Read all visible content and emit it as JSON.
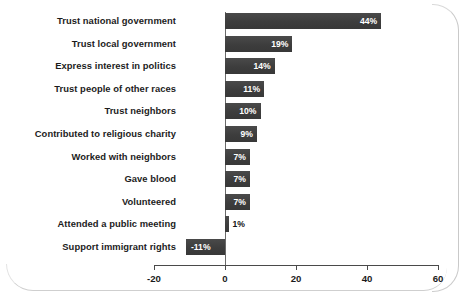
{
  "chart_data": {
    "type": "bar",
    "orientation": "horizontal",
    "title": "",
    "subtitle": "",
    "xlabel": "",
    "ylabel": "",
    "xlim": [
      -20,
      60
    ],
    "xticks": [
      -20,
      0,
      20,
      40,
      60
    ],
    "xtick_labels": [
      "-20",
      "0",
      "20",
      "40",
      "60"
    ],
    "grid": false,
    "legend": false,
    "value_suffix": "%",
    "bar_color": "#424242",
    "label_color_inside": "#ffffff",
    "label_color_outside": "#141414",
    "categories": [
      "Trust national government",
      "Trust local government",
      "Express interest in politics",
      "Trust people of other races",
      "Trust neighbors",
      "Contributed to religious charity",
      "Worked with neighbors",
      "Gave blood",
      "Volunteered",
      "Attended a public meeting",
      "Support immigrant rights"
    ],
    "values": [
      44,
      19,
      14,
      11,
      10,
      9,
      7,
      7,
      7,
      1,
      -11
    ],
    "value_labels": [
      "44%",
      "19%",
      "14%",
      "11%",
      "10%",
      "9%",
      "7%",
      "7%",
      "7%",
      "1%",
      "-11%"
    ],
    "label_placement": [
      "inside",
      "inside",
      "inside",
      "inside",
      "inside",
      "inside",
      "inside",
      "inside",
      "inside",
      "outside",
      "inside"
    ]
  }
}
